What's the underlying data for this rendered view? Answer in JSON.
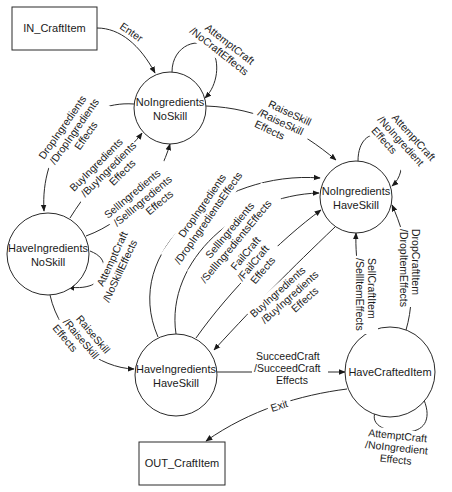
{
  "diagram": {
    "type": "state-transition",
    "terminals": {
      "in": {
        "label": "IN_CraftItem"
      },
      "out": {
        "label": "OUT_CraftItem"
      }
    },
    "states": {
      "no_ing_no_skill": {
        "line1": "NoIngredients",
        "line2": "NoSkill"
      },
      "have_ing_no_skill": {
        "line1": "HaveIngredients",
        "line2": "NoSkill"
      },
      "no_ing_have_skill": {
        "line1": "NoIngredients",
        "line2": "HaveSkill"
      },
      "have_ing_have_skill": {
        "line1": "HaveIngredients",
        "line2": "HaveSkill"
      },
      "have_crafted_item": {
        "line1": "HaveCraftedItem"
      }
    },
    "transitions": {
      "enter": {
        "l1": "Enter"
      },
      "nins_self": {
        "l1": "AttemptCraft",
        "l2": "/NoCraftEffects"
      },
      "nins_to_ninhs": {
        "l1": "RaiseSkill",
        "l2": "/RaiseSkill",
        "l3": "Effects"
      },
      "nins_to_hins": {
        "l1": "DropIngredients",
        "l2": "/DropIngredients",
        "l3": "Effects"
      },
      "hins_to_nins_buy": {
        "l1": "BuyIngredients",
        "l2": "/BuyIngredients",
        "l3": "Effects"
      },
      "hins_to_nins_sell": {
        "l1": "SellIngredients",
        "l2": "/SellIngredients",
        "l3": "Effects"
      },
      "hins_self": {
        "l1": "AttemptCraft",
        "l2": "/NoSkillEffects"
      },
      "hins_to_hihs": {
        "l1": "RaiseSkill",
        "l2": "/RaiseSkill",
        "l3": "Effects"
      },
      "ninhs_self": {
        "l1": "AttemptCraft",
        "l2": "/NoIngredient",
        "l3": "Effects"
      },
      "hihs_to_ninhs_drop": {
        "l1": "DropIngredients",
        "l2": "/DropIngredientsEffects"
      },
      "hihs_to_ninhs_sell": {
        "l1": "SellIngredients",
        "l2": "/SellIngredientsEffects"
      },
      "hihs_to_ninhs_fail": {
        "l1": "FailCraft",
        "l2": "/FailCraft",
        "l3": "Effects"
      },
      "ninhs_to_hihs_buy": {
        "l1": "BuyIngredients",
        "l2": "/BuyIngredients",
        "l3": "Effects"
      },
      "hci_to_ninhs_sell": {
        "l1": "SellCraftItem",
        "l2": "/SellItemEffects"
      },
      "hci_to_ninhs_drop": {
        "l1": "DropCraftItem",
        "l2": "/DropItemEffects"
      },
      "hihs_to_hci": {
        "l1": "SucceedCraft",
        "l2": "/SucceedCraft",
        "l3": "Effects"
      },
      "exit": {
        "l1": "Exit"
      },
      "hci_self": {
        "l1": "AttemptCraft",
        "l2": "/NoIngredient",
        "l3": "Effects"
      }
    }
  }
}
